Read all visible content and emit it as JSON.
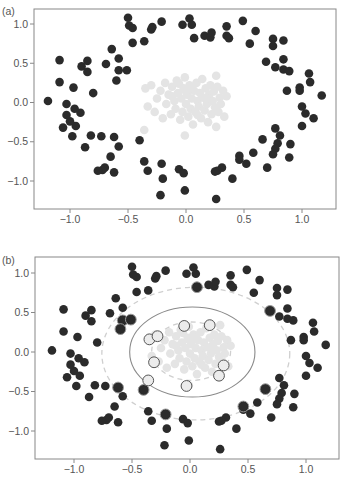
{
  "figure": {
    "panels": [
      {
        "label": "(a)"
      },
      {
        "label": "(b)"
      }
    ]
  },
  "chart_data": [
    {
      "type": "scatter",
      "panel": "(a)",
      "title": "",
      "xlabel": "",
      "ylabel": "",
      "xlim": [
        -1.3,
        1.3
      ],
      "ylim": [
        -1.35,
        1.2
      ],
      "xticks": [
        -1.0,
        -0.5,
        0.0,
        0.5,
        1.0
      ],
      "xtick_labels": [
        "−1.0",
        "−0.5",
        "0.0",
        "0.5",
        "1.0"
      ],
      "yticks": [
        1.0,
        0.5,
        0.0,
        -0.5,
        -1.0
      ],
      "ytick_labels": [
        "1.0",
        "0.5",
        "0.0",
        "−0.5",
        "−1.0"
      ],
      "grid": false,
      "legend": null,
      "colors": {
        "outer_class": "#2b2b2b",
        "inner_class": "#e4e4e4",
        "axes": "#888888"
      },
      "series": [
        {
          "name": "outer ring class",
          "color": "#2b2b2b",
          "marker_radius": 4.3,
          "points": [
            [
              -0.5,
              1.08
            ],
            [
              -0.49,
              0.98
            ],
            [
              -0.46,
              0.95
            ],
            [
              -0.46,
              0.76
            ],
            [
              -0.36,
              0.78
            ],
            [
              -0.3,
              0.93
            ],
            [
              -0.29,
              0.96
            ],
            [
              -0.21,
              1.03
            ],
            [
              -0.03,
              0.99
            ],
            [
              0.03,
              1.07
            ],
            [
              0.05,
              0.99
            ],
            [
              0.07,
              0.82
            ],
            [
              0.16,
              0.85
            ],
            [
              0.21,
              0.83
            ],
            [
              0.22,
              0.89
            ],
            [
              0.35,
              0.97
            ],
            [
              0.35,
              0.85
            ],
            [
              0.37,
              0.82
            ],
            [
              0.49,
              1.04
            ],
            [
              0.55,
              0.75
            ],
            [
              0.6,
              0.91
            ],
            [
              0.75,
              0.81
            ],
            [
              0.75,
              0.72
            ],
            [
              0.84,
              0.79
            ],
            [
              0.69,
              0.52
            ],
            [
              0.77,
              0.45
            ],
            [
              0.84,
              0.42
            ],
            [
              0.84,
              0.55
            ],
            [
              0.89,
              0.4
            ],
            [
              1.06,
              0.37
            ],
            [
              1.07,
              0.26
            ],
            [
              0.98,
              0.19
            ],
            [
              0.98,
              0.15
            ],
            [
              0.87,
              0.15
            ],
            [
              1.17,
              0.09
            ],
            [
              1.0,
              -0.05
            ],
            [
              1.03,
              -0.14
            ],
            [
              1.1,
              -0.2
            ],
            [
              1.0,
              -0.3
            ],
            [
              0.77,
              -0.33
            ],
            [
              0.81,
              -0.42
            ],
            [
              0.79,
              -0.52
            ],
            [
              0.77,
              -0.59
            ],
            [
              0.75,
              -0.66
            ],
            [
              0.9,
              -0.53
            ],
            [
              0.89,
              -0.7
            ],
            [
              0.66,
              -0.47
            ],
            [
              0.58,
              -0.64
            ],
            [
              0.46,
              -0.68
            ],
            [
              0.46,
              -0.73
            ],
            [
              0.52,
              -0.78
            ],
            [
              0.7,
              -0.83
            ],
            [
              0.4,
              -0.97
            ],
            [
              0.31,
              -0.83
            ],
            [
              0.27,
              -0.87
            ],
            [
              0.25,
              -0.88
            ],
            [
              0.26,
              -1.23
            ],
            [
              -0.01,
              -1.12
            ],
            [
              -0.06,
              -0.85
            ],
            [
              -0.02,
              -0.9
            ],
            [
              -0.2,
              -0.97
            ],
            [
              -0.21,
              -0.78
            ],
            [
              -0.22,
              -1.18
            ],
            [
              -0.33,
              -0.87
            ],
            [
              -0.36,
              -0.75
            ],
            [
              -0.4,
              -0.48
            ],
            [
              -0.58,
              -0.56
            ],
            [
              -0.62,
              -0.44
            ],
            [
              -0.65,
              -0.69
            ],
            [
              -0.62,
              -0.89
            ],
            [
              -0.7,
              -0.83
            ],
            [
              -0.72,
              -0.86
            ],
            [
              -0.76,
              -0.87
            ],
            [
              -0.73,
              -0.43
            ],
            [
              -0.82,
              -0.42
            ],
            [
              -0.87,
              -0.57
            ],
            [
              -0.98,
              -0.43
            ],
            [
              -0.95,
              -0.3
            ],
            [
              -1.0,
              -0.24
            ],
            [
              -1.03,
              -0.16
            ],
            [
              -0.91,
              -0.13
            ],
            [
              -0.96,
              -0.08
            ],
            [
              -1.03,
              -0.02
            ],
            [
              -1.06,
              -0.32
            ],
            [
              -1.19,
              0.02
            ],
            [
              -1.09,
              0.26
            ],
            [
              -0.97,
              0.19
            ],
            [
              -0.8,
              0.12
            ],
            [
              -1.09,
              0.54
            ],
            [
              -0.9,
              0.46
            ],
            [
              -0.85,
              0.53
            ],
            [
              -0.85,
              0.39
            ],
            [
              -0.69,
              0.49
            ],
            [
              -0.64,
              0.68
            ],
            [
              -0.58,
              0.56
            ],
            [
              -0.58,
              0.41
            ],
            [
              -0.6,
              0.28
            ],
            [
              -0.51,
              0.41
            ]
          ]
        },
        {
          "name": "inner cluster class",
          "color": "#e4e4e4",
          "marker_radius": 4.3,
          "points": [
            [
              -0.35,
              0.18
            ],
            [
              -0.33,
              -0.05
            ],
            [
              -0.3,
              0.22
            ],
            [
              -0.27,
              -0.12
            ],
            [
              -0.25,
              0.05
            ],
            [
              -0.22,
              0.15
            ],
            [
              -0.2,
              -0.2
            ],
            [
              -0.18,
              0.25
            ],
            [
              -0.17,
              -0.02
            ],
            [
              -0.15,
              0.1
            ],
            [
              -0.13,
              -0.15
            ],
            [
              -0.12,
              0.2
            ],
            [
              -0.1,
              0.02
            ],
            [
              -0.09,
              -0.08
            ],
            [
              -0.08,
              0.28
            ],
            [
              -0.07,
              0.12
            ],
            [
              -0.05,
              -0.22
            ],
            [
              -0.04,
              0.05
            ],
            [
              -0.03,
              -0.12
            ],
            [
              -0.02,
              0.18
            ],
            [
              -0.01,
              0.32
            ],
            [
              0.0,
              -0.02
            ],
            [
              0.01,
              0.1
            ],
            [
              0.02,
              -0.18
            ],
            [
              0.03,
              0.22
            ],
            [
              0.04,
              -0.08
            ],
            [
              0.05,
              0.05
            ],
            [
              0.06,
              -0.28
            ],
            [
              0.07,
              0.15
            ],
            [
              0.08,
              -0.12
            ],
            [
              0.09,
              0.25
            ],
            [
              0.1,
              0.02
            ],
            [
              0.11,
              -0.05
            ],
            [
              0.12,
              0.12
            ],
            [
              0.13,
              -0.2
            ],
            [
              0.14,
              0.3
            ],
            [
              0.15,
              0.06
            ],
            [
              0.16,
              -0.1
            ],
            [
              0.17,
              0.18
            ],
            [
              0.18,
              -0.02
            ],
            [
              0.19,
              -0.25
            ],
            [
              0.2,
              0.1
            ],
            [
              0.21,
              0.22
            ],
            [
              0.22,
              -0.15
            ],
            [
              0.23,
              0.02
            ],
            [
              0.24,
              0.14
            ],
            [
              0.25,
              -0.06
            ],
            [
              0.26,
              0.34
            ],
            [
              0.27,
              0.2
            ],
            [
              0.28,
              -0.12
            ],
            [
              0.29,
              0.06
            ],
            [
              0.3,
              -0.02
            ],
            [
              0.32,
              0.15
            ],
            [
              0.33,
              -0.18
            ],
            [
              0.35,
              0.08
            ],
            [
              -0.01,
              -0.42
            ],
            [
              -0.36,
              -0.35
            ],
            [
              0.26,
              -0.31
            ],
            [
              -0.12,
              0.08
            ],
            [
              0.05,
              0.18
            ],
            [
              0.1,
              -0.16
            ],
            [
              -0.06,
              0.24
            ],
            [
              0.18,
              0.05
            ],
            [
              0.0,
              0.14
            ]
          ]
        }
      ]
    },
    {
      "type": "scatter",
      "panel": "(b)",
      "title": "",
      "xlabel": "",
      "ylabel": "",
      "xlim": [
        -1.3,
        1.3
      ],
      "ylim": [
        -1.35,
        1.2
      ],
      "xticks": [
        -1.0,
        -0.5,
        0.0,
        0.5,
        1.0
      ],
      "xtick_labels": [
        "−1.0",
        "−0.5",
        "0.0",
        "0.5",
        "1.0"
      ],
      "yticks": [
        1.0,
        0.5,
        0.0,
        -0.5,
        -1.0
      ],
      "ytick_labels": [
        "1.0",
        "0.5",
        "0.0",
        "−0.5",
        "−1.0"
      ],
      "grid": false,
      "legend": null,
      "same_points_as": "(a)",
      "decision_boundary": {
        "shape": "ellipse",
        "style": "solid",
        "color": "#8a8a8a",
        "center": [
          0.02,
          0.0
        ],
        "rx": 0.54,
        "ry": 0.57
      },
      "margins": [
        {
          "shape": "ellipse",
          "style": "dashed",
          "color": "#cfcfcf",
          "center": [
            0.05,
            -0.02
          ],
          "rx": 0.81,
          "ry": 0.84
        },
        {
          "shape": "ellipse",
          "style": "dashed",
          "color": "#cfcfcf",
          "center": [
            0.01,
            0.01
          ],
          "rx": 0.34,
          "ry": 0.37
        }
      ],
      "support_vectors": {
        "inner_class": [
          [
            -0.05,
            0.33
          ],
          [
            0.17,
            0.34
          ],
          [
            -0.35,
            0.16
          ],
          [
            -0.28,
            0.2
          ],
          [
            -0.31,
            -0.13
          ],
          [
            -0.36,
            -0.36
          ],
          [
            -0.03,
            -0.43
          ],
          [
            0.25,
            -0.3
          ],
          [
            0.29,
            -0.17
          ]
        ],
        "outer_class": [
          [
            0.06,
            0.82
          ],
          [
            -0.58,
            0.4
          ],
          [
            -0.6,
            0.29
          ],
          [
            -0.51,
            0.41
          ],
          [
            0.69,
            0.52
          ],
          [
            -0.62,
            -0.45
          ],
          [
            -0.4,
            -0.48
          ],
          [
            0.65,
            -0.47
          ],
          [
            0.46,
            -0.69
          ],
          [
            -0.21,
            -0.79
          ]
        ]
      }
    }
  ]
}
